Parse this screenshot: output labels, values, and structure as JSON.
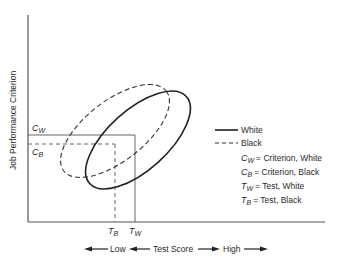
{
  "diagram": {
    "y_axis_label": "Job Performance Criterion",
    "x_axis": {
      "low_label": "Low",
      "center_label": "Test Score",
      "high_label": "High"
    },
    "markers": {
      "cw": {
        "main": "C",
        "sub": "W"
      },
      "cb": {
        "main": "C",
        "sub": "B"
      },
      "tb": {
        "main": "T",
        "sub": "B"
      },
      "tw": {
        "main": "T",
        "sub": "W"
      }
    },
    "legend": {
      "white": "White",
      "black": "Black",
      "definitions": [
        {
          "main": "C",
          "sub": "W",
          "text": "= Criterion, White"
        },
        {
          "main": "C",
          "sub": "B",
          "text": "= Criterion, Black"
        },
        {
          "main": "T",
          "sub": "W",
          "text": "= Test, White"
        },
        {
          "main": "T",
          "sub": "B",
          "text": "= Test, Black"
        }
      ]
    },
    "series": [
      {
        "name": "White",
        "style": "solid",
        "shape": "ellipse",
        "center": [
          138,
          140
        ],
        "rx": 65,
        "ry": 30,
        "rotation_deg": -42
      },
      {
        "name": "Black",
        "style": "dashed",
        "shape": "ellipse",
        "center": [
          115,
          131
        ],
        "rx": 65,
        "ry": 30,
        "rotation_deg": -38
      }
    ],
    "colors": {
      "line": "#2a2a2a",
      "axis": "#555555",
      "background": "#ffffff"
    }
  }
}
